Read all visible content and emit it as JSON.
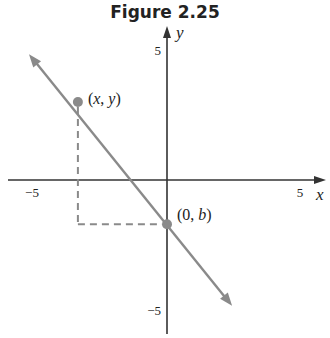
{
  "title": "Figure 2.25",
  "axes": {
    "x_label": "x",
    "y_label": "y",
    "x_ticks": [
      {
        "value": -5,
        "label": "−5"
      },
      {
        "value": 5,
        "label": "5"
      }
    ],
    "y_ticks": [
      {
        "value": 5,
        "label": "5"
      },
      {
        "value": -5,
        "label": "−5"
      }
    ],
    "xlim": [
      -6,
      6
    ],
    "ylim": [
      -6,
      6
    ]
  },
  "line": {
    "description": "line with negative slope and arrows at both ends",
    "color": "#8a8a8a",
    "from": [
      -5,
      4.7
    ],
    "to": [
      2.3,
      -4.7
    ]
  },
  "points": [
    {
      "id": "xy",
      "label_parts": [
        "(",
        "x",
        ", ",
        "y",
        ")"
      ],
      "x": -3.3,
      "y": 3.0
    },
    {
      "id": "0b",
      "label_parts": [
        "(0, ",
        "b",
        ")"
      ],
      "x": 0,
      "y": -1.7
    }
  ],
  "dashed_guides": {
    "color": "#8a8a8a",
    "description": "vertical from (x,y) down to y=b, horizontal to (0,b)"
  },
  "colors": {
    "axis": "#333333",
    "point": "#8a8a8a"
  }
}
